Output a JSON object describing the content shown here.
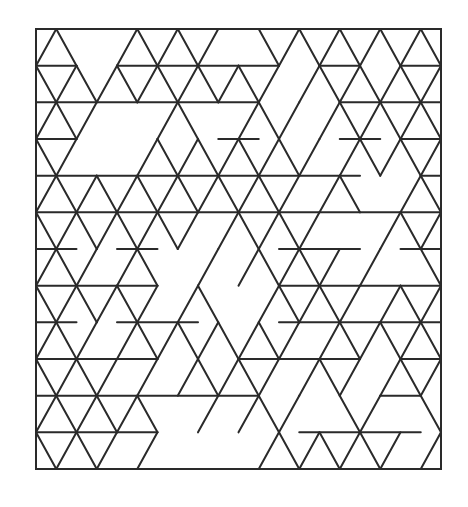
{
  "figure": {
    "type": "triangular-grid tiling",
    "stroke_color": "#2a2a2a",
    "stroke_width": 2,
    "background": "#ffffff",
    "frame": {
      "x0": 36,
      "y0": 29,
      "x1": 441,
      "y1": 469
    },
    "grid": {
      "origin_x": 36,
      "origin_y": 29,
      "half_step": 20.25,
      "row_height": 36.667,
      "rows": 12,
      "cols": 20
    },
    "horizontals": [
      [
        1,
        0,
        2
      ],
      [
        1,
        4,
        12
      ],
      [
        1,
        14,
        16
      ],
      [
        1,
        18,
        20
      ],
      [
        2,
        0,
        11
      ],
      [
        2,
        15,
        20
      ],
      [
        3,
        0,
        2
      ],
      [
        3,
        9,
        11
      ],
      [
        3,
        15,
        17
      ],
      [
        3,
        18,
        20
      ],
      [
        4,
        0,
        16
      ],
      [
        4,
        19,
        20
      ],
      [
        5,
        0,
        20
      ],
      [
        6,
        0,
        2
      ],
      [
        6,
        4,
        6
      ],
      [
        6,
        12,
        16
      ],
      [
        6,
        18,
        20
      ],
      [
        7,
        0,
        6
      ],
      [
        7,
        12,
        20
      ],
      [
        8,
        0,
        2
      ],
      [
        8,
        4,
        8
      ],
      [
        8,
        12,
        20
      ],
      [
        9,
        0,
        6
      ],
      [
        9,
        10,
        16
      ],
      [
        9,
        18,
        20
      ],
      [
        10,
        0,
        11
      ],
      [
        10,
        17,
        19
      ],
      [
        11,
        0,
        6
      ],
      [
        11,
        13,
        19
      ]
    ],
    "diagonals": [
      [
        0,
        1,
        0
      ],
      [
        0,
        1,
        2
      ],
      [
        0,
        5,
        4
      ],
      [
        0,
        5,
        6
      ],
      [
        0,
        7,
        6
      ],
      [
        0,
        7,
        8
      ],
      [
        0,
        9,
        8
      ],
      [
        0,
        11,
        12
      ],
      [
        0,
        13,
        12
      ],
      [
        0,
        13,
        14
      ],
      [
        0,
        15,
        14
      ],
      [
        0,
        15,
        16
      ],
      [
        0,
        17,
        16
      ],
      [
        0,
        17,
        18
      ],
      [
        0,
        19,
        18
      ],
      [
        0,
        19,
        20
      ],
      [
        1,
        0,
        1
      ],
      [
        1,
        2,
        1
      ],
      [
        1,
        2,
        3
      ],
      [
        1,
        4,
        3
      ],
      [
        1,
        4,
        5
      ],
      [
        1,
        6,
        5
      ],
      [
        1,
        6,
        7
      ],
      [
        1,
        8,
        7
      ],
      [
        1,
        8,
        9
      ],
      [
        1,
        10,
        9
      ],
      [
        1,
        10,
        11
      ],
      [
        1,
        12,
        11
      ],
      [
        1,
        14,
        13
      ],
      [
        1,
        14,
        15
      ],
      [
        1,
        16,
        15
      ],
      [
        1,
        16,
        17
      ],
      [
        1,
        18,
        17
      ],
      [
        1,
        18,
        19
      ],
      [
        1,
        20,
        19
      ],
      [
        2,
        1,
        0
      ],
      [
        2,
        1,
        2
      ],
      [
        2,
        3,
        2
      ],
      [
        2,
        7,
        6
      ],
      [
        2,
        7,
        8
      ],
      [
        2,
        11,
        10
      ],
      [
        2,
        11,
        12
      ],
      [
        2,
        13,
        12
      ],
      [
        2,
        15,
        14
      ],
      [
        2,
        15,
        16
      ],
      [
        2,
        17,
        16
      ],
      [
        2,
        17,
        18
      ],
      [
        2,
        19,
        18
      ],
      [
        2,
        19,
        20
      ],
      [
        3,
        0,
        1
      ],
      [
        3,
        2,
        1
      ],
      [
        3,
        6,
        5
      ],
      [
        3,
        6,
        7
      ],
      [
        3,
        8,
        7
      ],
      [
        3,
        8,
        9
      ],
      [
        3,
        10,
        9
      ],
      [
        3,
        10,
        11
      ],
      [
        3,
        12,
        11
      ],
      [
        3,
        12,
        13
      ],
      [
        3,
        14,
        13
      ],
      [
        3,
        16,
        15
      ],
      [
        3,
        16,
        17
      ],
      [
        3,
        18,
        17
      ],
      [
        3,
        18,
        19
      ],
      [
        3,
        20,
        19
      ],
      [
        4,
        1,
        0
      ],
      [
        4,
        1,
        2
      ],
      [
        4,
        3,
        2
      ],
      [
        4,
        3,
        4
      ],
      [
        4,
        5,
        4
      ],
      [
        4,
        5,
        6
      ],
      [
        4,
        7,
        6
      ],
      [
        4,
        7,
        8
      ],
      [
        4,
        9,
        8
      ],
      [
        4,
        9,
        10
      ],
      [
        4,
        11,
        10
      ],
      [
        4,
        11,
        12
      ],
      [
        4,
        13,
        12
      ],
      [
        4,
        15,
        14
      ],
      [
        4,
        15,
        16
      ],
      [
        4,
        19,
        18
      ],
      [
        4,
        19,
        20
      ],
      [
        5,
        0,
        1
      ],
      [
        5,
        2,
        1
      ],
      [
        5,
        2,
        3
      ],
      [
        5,
        4,
        3
      ],
      [
        5,
        4,
        5
      ],
      [
        5,
        6,
        5
      ],
      [
        5,
        6,
        7
      ],
      [
        5,
        8,
        7
      ],
      [
        5,
        10,
        9
      ],
      [
        5,
        10,
        11
      ],
      [
        5,
        12,
        11
      ],
      [
        5,
        12,
        13
      ],
      [
        5,
        14,
        13
      ],
      [
        5,
        18,
        17
      ],
      [
        5,
        18,
        19
      ],
      [
        5,
        20,
        19
      ],
      [
        6,
        1,
        0
      ],
      [
        6,
        1,
        2
      ],
      [
        6,
        3,
        2
      ],
      [
        6,
        5,
        4
      ],
      [
        6,
        5,
        6
      ],
      [
        6,
        9,
        8
      ],
      [
        6,
        11,
        10
      ],
      [
        6,
        11,
        12
      ],
      [
        6,
        13,
        12
      ],
      [
        6,
        13,
        14
      ],
      [
        6,
        15,
        14
      ],
      [
        6,
        17,
        16
      ],
      [
        6,
        19,
        20
      ],
      [
        7,
        0,
        1
      ],
      [
        7,
        2,
        1
      ],
      [
        7,
        2,
        3
      ],
      [
        7,
        4,
        3
      ],
      [
        7,
        4,
        5
      ],
      [
        7,
        6,
        5
      ],
      [
        7,
        8,
        7
      ],
      [
        7,
        8,
        9
      ],
      [
        7,
        12,
        11
      ],
      [
        7,
        12,
        13
      ],
      [
        7,
        14,
        13
      ],
      [
        7,
        14,
        15
      ],
      [
        7,
        16,
        15
      ],
      [
        7,
        18,
        17
      ],
      [
        7,
        18,
        19
      ],
      [
        7,
        20,
        19
      ],
      [
        8,
        1,
        0
      ],
      [
        8,
        1,
        2
      ],
      [
        8,
        3,
        2
      ],
      [
        8,
        5,
        4
      ],
      [
        8,
        5,
        6
      ],
      [
        8,
        7,
        6
      ],
      [
        8,
        7,
        8
      ],
      [
        8,
        9,
        8
      ],
      [
        8,
        9,
        10
      ],
      [
        8,
        11,
        10
      ],
      [
        8,
        11,
        12
      ],
      [
        8,
        13,
        12
      ],
      [
        8,
        15,
        14
      ],
      [
        8,
        15,
        16
      ],
      [
        8,
        17,
        16
      ],
      [
        8,
        17,
        18
      ],
      [
        8,
        19,
        18
      ],
      [
        8,
        19,
        20
      ],
      [
        9,
        0,
        1
      ],
      [
        9,
        2,
        1
      ],
      [
        9,
        2,
        3
      ],
      [
        9,
        4,
        3
      ],
      [
        9,
        6,
        5
      ],
      [
        9,
        8,
        7
      ],
      [
        9,
        8,
        9
      ],
      [
        9,
        10,
        9
      ],
      [
        9,
        10,
        11
      ],
      [
        9,
        12,
        11
      ],
      [
        9,
        14,
        13
      ],
      [
        9,
        14,
        15
      ],
      [
        9,
        16,
        15
      ],
      [
        9,
        18,
        17
      ],
      [
        9,
        18,
        19
      ],
      [
        9,
        20,
        19
      ],
      [
        10,
        1,
        0
      ],
      [
        10,
        1,
        2
      ],
      [
        10,
        3,
        2
      ],
      [
        10,
        3,
        4
      ],
      [
        10,
        5,
        4
      ],
      [
        10,
        5,
        6
      ],
      [
        10,
        9,
        8
      ],
      [
        10,
        11,
        10
      ],
      [
        10,
        11,
        12
      ],
      [
        10,
        13,
        12
      ],
      [
        10,
        15,
        16
      ],
      [
        10,
        17,
        16
      ],
      [
        10,
        19,
        20
      ],
      [
        11,
        0,
        1
      ],
      [
        11,
        2,
        1
      ],
      [
        11,
        2,
        3
      ],
      [
        11,
        4,
        3
      ],
      [
        11,
        6,
        5
      ],
      [
        11,
        12,
        11
      ],
      [
        11,
        12,
        13
      ],
      [
        11,
        14,
        13
      ],
      [
        11,
        14,
        15
      ],
      [
        11,
        16,
        15
      ],
      [
        11,
        16,
        17
      ],
      [
        11,
        18,
        17
      ],
      [
        11,
        20,
        19
      ]
    ]
  }
}
